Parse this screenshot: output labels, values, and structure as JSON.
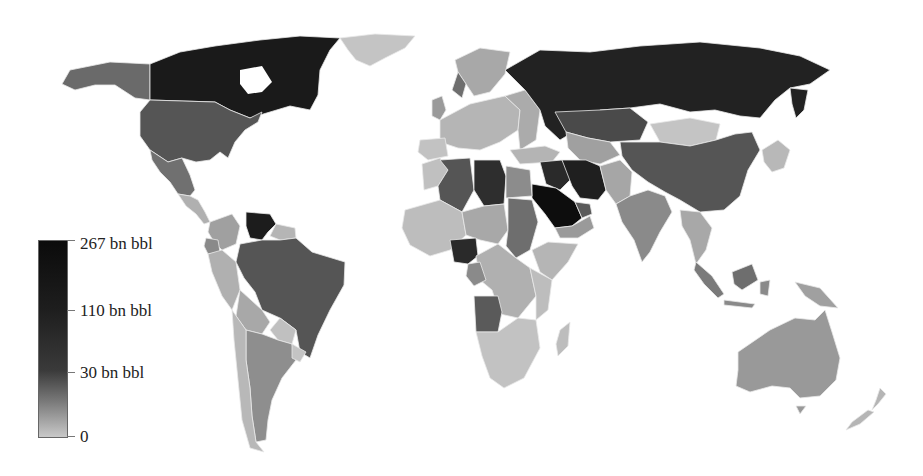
{
  "map": {
    "title": "",
    "subject": "Proven oil reserves by country",
    "color_scale": {
      "type": "grayscale",
      "low_color": "#c8c8c8",
      "high_color": "#0b0b0b"
    },
    "legend": {
      "ticks": [
        {
          "label": "267 bn bbl",
          "value": 267
        },
        {
          "label": "110 bn bbl",
          "value": 110
        },
        {
          "label": "30 bn bbl",
          "value": 30
        },
        {
          "label": "0",
          "value": 0
        }
      ]
    },
    "region_tones": {
      "darkest": "#0d0d0d",
      "very_dark": "#1f1f1f",
      "dark": "#333333",
      "medium_dark": "#555555",
      "medium": "#6e6e6e",
      "medium_light": "#8c8c8c",
      "light": "#a8a8a8",
      "lightest": "#c4c4c4"
    },
    "countries": [
      {
        "name": "Saudi Arabia",
        "tone": "darkest"
      },
      {
        "name": "Venezuela",
        "tone": "very_dark"
      },
      {
        "name": "Canada",
        "tone": "very_dark"
      },
      {
        "name": "Iran",
        "tone": "very_dark"
      },
      {
        "name": "Iraq",
        "tone": "very_dark"
      },
      {
        "name": "Kuwait",
        "tone": "very_dark"
      },
      {
        "name": "UAE",
        "tone": "very_dark"
      },
      {
        "name": "Russia",
        "tone": "very_dark"
      },
      {
        "name": "Libya",
        "tone": "dark"
      },
      {
        "name": "Nigeria",
        "tone": "dark"
      },
      {
        "name": "Kazakhstan",
        "tone": "medium_dark"
      },
      {
        "name": "United States",
        "tone": "medium_dark"
      },
      {
        "name": "China",
        "tone": "medium_dark"
      },
      {
        "name": "Brazil",
        "tone": "medium_dark"
      },
      {
        "name": "Algeria",
        "tone": "medium_dark"
      },
      {
        "name": "Angola",
        "tone": "medium_dark"
      },
      {
        "name": "Qatar",
        "tone": "medium_dark"
      },
      {
        "name": "Mexico",
        "tone": "medium"
      },
      {
        "name": "Sudan",
        "tone": "medium"
      },
      {
        "name": "Indonesia",
        "tone": "medium"
      },
      {
        "name": "Malaysia",
        "tone": "medium"
      },
      {
        "name": "India",
        "tone": "medium"
      },
      {
        "name": "Ecuador",
        "tone": "medium"
      },
      {
        "name": "Norway",
        "tone": "medium"
      },
      {
        "name": "Australia",
        "tone": "medium_light"
      },
      {
        "name": "Alaska (US)",
        "tone": "medium_dark"
      },
      {
        "name": "Greenland",
        "tone": "lightest"
      },
      {
        "name": "Mongolia",
        "tone": "lightest"
      }
    ]
  }
}
